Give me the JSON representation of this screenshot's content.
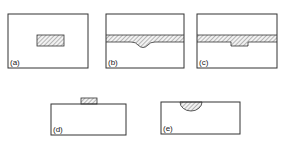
{
  "figure": {
    "panels": [
      {
        "id": "a",
        "label": "(a)",
        "description": "Substrate with embedded hatched rectangular region"
      },
      {
        "id": "b",
        "label": "(b)",
        "description": "Substrate with hatched layer band with rounded downward bulge"
      },
      {
        "id": "c",
        "label": "(c)",
        "description": "Substrate with hatched layer band with rectangular downward notch"
      },
      {
        "id": "d",
        "label": "(d)",
        "description": "Substrate with hatched block deposited on top surface"
      },
      {
        "id": "e",
        "label": "(e)",
        "description": "Substrate with hatched semicircular region at top surface"
      }
    ],
    "colors": {
      "stroke": "#333333",
      "hatch": "#777777",
      "background": "#ffffff"
    }
  }
}
